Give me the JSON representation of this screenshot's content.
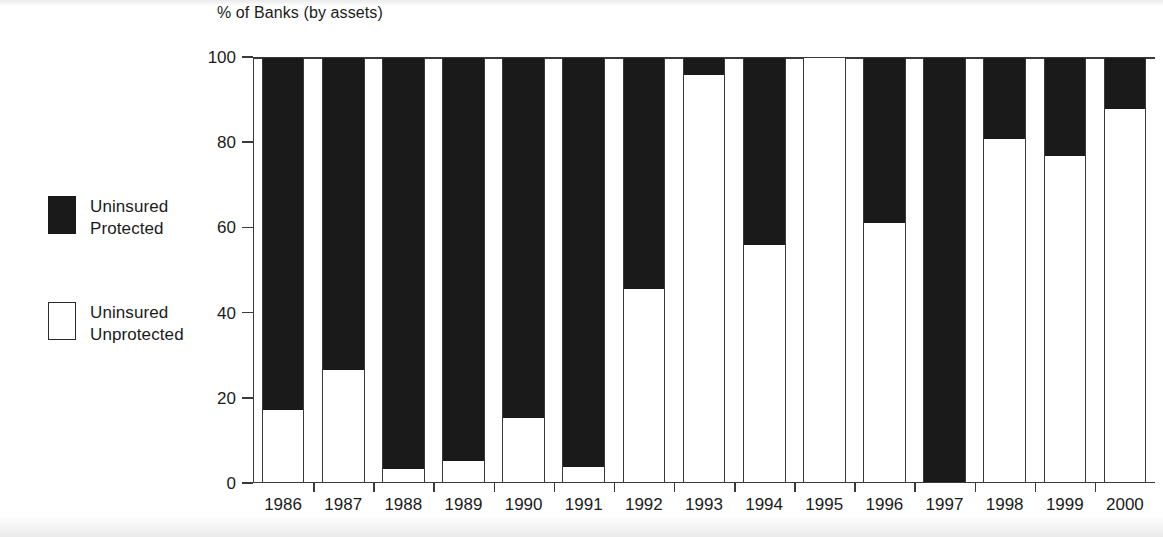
{
  "legend": {
    "items": [
      {
        "swatch": "filled-black-square",
        "line1": "Uninsured",
        "line2": "Protected"
      },
      {
        "swatch": "hollow-white-square",
        "line1": "Uninsured",
        "line2": "Unprotected"
      }
    ]
  },
  "axis": {
    "y_title": "% of Banks (by assets)",
    "y_ticks": [
      "0",
      "20",
      "40",
      "60",
      "80",
      "100"
    ]
  },
  "colors": {
    "protected": "#1a1a1a",
    "unprotected": "#ffffff",
    "axis": "#3a3a3a",
    "background": "#ffffff"
  },
  "chart_data": {
    "type": "bar",
    "stacked": true,
    "title": "",
    "subtitle": "",
    "xlabel": "",
    "ylabel": "% of Banks (by assets)",
    "ylim": [
      0,
      100
    ],
    "yticks": [
      0,
      20,
      40,
      60,
      80,
      100
    ],
    "grid": false,
    "legend_position": "left-outside",
    "categories": [
      "1986",
      "1987",
      "1988",
      "1989",
      "1990",
      "1991",
      "1992",
      "1993",
      "1994",
      "1995",
      "1996",
      "1997",
      "1998",
      "1999",
      "2000"
    ],
    "series": [
      {
        "name": "Uninsured Unprotected",
        "color": "#ffffff",
        "values": [
          17,
          26.5,
          3,
          5,
          15,
          3.5,
          45.5,
          96,
          56,
          100,
          61,
          0,
          81,
          77,
          88
        ]
      },
      {
        "name": "Uninsured Protected",
        "color": "#1a1a1a",
        "values": [
          83,
          73.5,
          97,
          95,
          85,
          96.5,
          54.5,
          4,
          44,
          0,
          39,
          100,
          19,
          23,
          12
        ]
      }
    ],
    "annotations": []
  }
}
